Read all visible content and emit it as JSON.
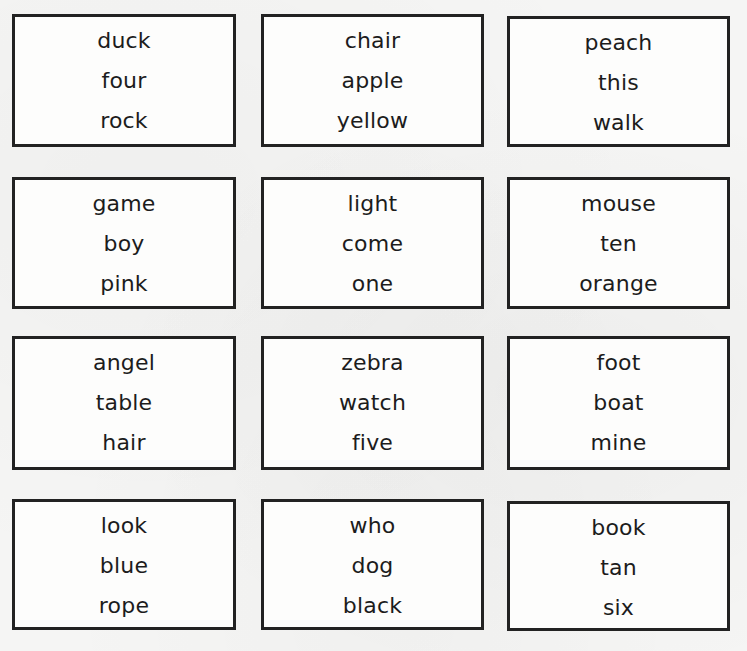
{
  "worksheet": {
    "cards": [
      {
        "words": [
          "duck",
          "four",
          "rock"
        ]
      },
      {
        "words": [
          "chair",
          "apple",
          "yellow"
        ]
      },
      {
        "words": [
          "peach",
          "this",
          "walk"
        ]
      },
      {
        "words": [
          "game",
          "boy",
          "pink"
        ]
      },
      {
        "words": [
          "light",
          "come",
          "one"
        ]
      },
      {
        "words": [
          "mouse",
          "ten",
          "orange"
        ]
      },
      {
        "words": [
          "angel",
          "table",
          "hair"
        ]
      },
      {
        "words": [
          "zebra",
          "watch",
          "five"
        ]
      },
      {
        "words": [
          "foot",
          "boat",
          "mine"
        ]
      },
      {
        "words": [
          "look",
          "blue",
          "rope"
        ]
      },
      {
        "words": [
          "who",
          "dog",
          "black"
        ]
      },
      {
        "words": [
          "book",
          "tan",
          "six"
        ]
      }
    ],
    "colors": {
      "border": "#222222",
      "text": "#1c1c1c",
      "paper": "#f5f5f4"
    }
  }
}
